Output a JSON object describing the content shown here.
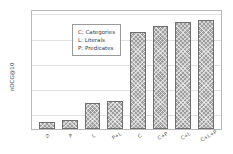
{
  "chart_data": {
    "type": "bar",
    "title": "",
    "xlabel": "",
    "ylabel": "nDCG@10",
    "ylim": [
      0.17,
      0.265
    ],
    "yticks": [
      "0.18",
      "0.20",
      "0.22",
      "0.24",
      "0.26"
    ],
    "ytick_values": [
      0.18,
      0.2,
      0.22,
      0.24,
      0.26
    ],
    "grid": true,
    "legend_position": "upper left",
    "categories": [
      "∅",
      "P",
      "L",
      "P+L",
      "C",
      "C+P",
      "C+L",
      "C+L+P"
    ],
    "values": [
      0.1755,
      0.1775,
      0.1905,
      0.1925,
      0.2465,
      0.2515,
      0.2545,
      0.2565
    ],
    "legend_entries": [
      "C: Categories",
      "L: Literals",
      "P: Predicates"
    ],
    "bar_color": "#9e9e9e",
    "bar_edge_color": "#6f6f6f",
    "grid_color": "#e2e2e2",
    "axis_color": "#b9b9b9",
    "text_color": "#4d4d4d"
  }
}
